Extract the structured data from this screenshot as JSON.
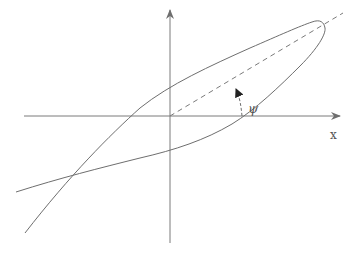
{
  "diagram": {
    "type": "polarization-ellipse",
    "labels": {
      "x_axis": "x",
      "angle": "ψ"
    },
    "colors": {
      "stroke": "#6e6e6e",
      "axis": "#7a7a7a",
      "background": "#ffffff"
    },
    "elements": [
      "vertical-axis-with-arrow",
      "horizontal-axis-with-arrow",
      "tilted-ellipse-curve",
      "dashed-major-axis",
      "curved-angle-arrow"
    ]
  }
}
